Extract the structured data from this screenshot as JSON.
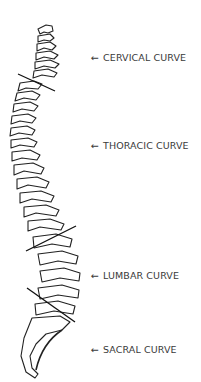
{
  "diagram": {
    "title": "",
    "labels": [
      {
        "arrow": "←",
        "text": "CERVICAL CURVE",
        "y": 52
      },
      {
        "arrow": "←",
        "text": "THORACIC CURVE",
        "y": 140
      },
      {
        "arrow": "←",
        "text": "LUMBAR CURVE",
        "y": 270
      },
      {
        "arrow": "←",
        "text": "SACRAL CURVE",
        "y": 344
      }
    ],
    "colors": {
      "stroke": "#222222",
      "text": "#3a3a3a",
      "background": "#ffffff"
    }
  }
}
